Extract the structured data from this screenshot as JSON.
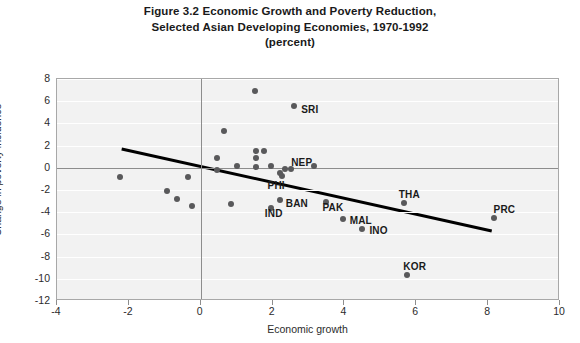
{
  "figure": {
    "title_lines": [
      "Figure 3.2 Economic Growth and Poverty Reduction,",
      "Selected Asian Developing Economies, 1970-1992",
      "(percent)"
    ],
    "title_line1": "Figure 3.2 Economic Growth and Poverty Reduction,",
    "title_line2": "Selected Asian Developing Economies, 1970-1992",
    "title_line3": "(percent)"
  },
  "chart_data": {
    "type": "scatter",
    "title": "Figure 3.2 Economic Growth and Poverty Reduction, Selected Asian Developing Economies, 1970-1992 (percent)",
    "xlabel": "Economic growth",
    "ylabel": "Change in poverty incidence",
    "xlim": [
      -4,
      10
    ],
    "ylim": [
      -12,
      8
    ],
    "xticks": [
      -4,
      -2,
      0,
      2,
      4,
      6,
      8,
      10
    ],
    "yticks": [
      8,
      6,
      4,
      2,
      0,
      -2,
      -4,
      -6,
      -8,
      -10,
      -12
    ],
    "xtick_labels": [
      "-4",
      "-2",
      "0",
      "2",
      "4",
      "6",
      "8",
      "10"
    ],
    "ytick_labels": [
      "8",
      "6",
      "4",
      "2",
      "0",
      "-2",
      "-4",
      "-6",
      "-8",
      "-10",
      "-12"
    ],
    "grid": "horizontal",
    "legend": "none",
    "marker_color": "#59595b",
    "plot_background": "#f2f2f2",
    "trendline": {
      "color": "#000000",
      "width_px": 3,
      "x_start": -2.2,
      "y_start": 1.7,
      "x_end": 8.1,
      "y_end": -5.7
    },
    "points": [
      {
        "label": "",
        "x": 1.5,
        "y": 6.9
      },
      {
        "label": "SRI",
        "x": 2.6,
        "y": 5.6,
        "label_dx": 7,
        "label_dy": 4
      },
      {
        "label": "",
        "x": 0.65,
        "y": 3.3
      },
      {
        "label": "",
        "x": 1.55,
        "y": 1.5
      },
      {
        "label": "",
        "x": 1.75,
        "y": 1.5
      },
      {
        "label": "",
        "x": 1.55,
        "y": 0.85
      },
      {
        "label": "",
        "x": 0.45,
        "y": 0.85
      },
      {
        "label": "",
        "x": 1.0,
        "y": 0.2
      },
      {
        "label": "",
        "x": 1.55,
        "y": 0.05
      },
      {
        "label": "",
        "x": 1.95,
        "y": 0.15
      },
      {
        "label": "NEP",
        "x": 2.35,
        "y": -0.1,
        "label_dx": 6,
        "label_dy": -6
      },
      {
        "label": "",
        "x": 2.5,
        "y": -0.1
      },
      {
        "label": "",
        "x": 3.15,
        "y": 0.2
      },
      {
        "label": "",
        "x": 0.45,
        "y": -0.2
      },
      {
        "label": "PHI",
        "x": 2.25,
        "y": -0.75,
        "label_dx": -14,
        "label_dy": 10
      },
      {
        "label": "",
        "x": 2.2,
        "y": -0.45
      },
      {
        "label": "",
        "x": -0.35,
        "y": -0.8
      },
      {
        "label": "",
        "x": -2.25,
        "y": -0.8
      },
      {
        "label": "",
        "x": -0.95,
        "y": -2.1
      },
      {
        "label": "",
        "x": -0.65,
        "y": -2.8
      },
      {
        "label": "",
        "x": -0.25,
        "y": -3.4
      },
      {
        "label": "",
        "x": 0.85,
        "y": -3.3
      },
      {
        "label": "IND",
        "x": 1.95,
        "y": -3.6,
        "label_dx": -6,
        "label_dy": 6
      },
      {
        "label": "BAN",
        "x": 2.2,
        "y": -2.9,
        "label_dx": 6,
        "label_dy": 4
      },
      {
        "label": "PAK",
        "x": 3.5,
        "y": -3.1,
        "label_dx": -4,
        "label_dy": 6
      },
      {
        "label": "MAL",
        "x": 3.95,
        "y": -4.6,
        "label_dx": 7,
        "label_dy": 2
      },
      {
        "label": "INO",
        "x": 4.5,
        "y": -5.5,
        "label_dx": 7,
        "label_dy": 2
      },
      {
        "label": "THA",
        "x": 5.65,
        "y": -3.2,
        "label_dx": -5,
        "label_dy": -8
      },
      {
        "label": "KOR",
        "x": 5.75,
        "y": -9.7,
        "label_dx": -4,
        "label_dy": -8
      },
      {
        "label": "PRC",
        "x": 8.15,
        "y": -4.55,
        "label_dx": 0,
        "label_dy": -8
      }
    ]
  }
}
